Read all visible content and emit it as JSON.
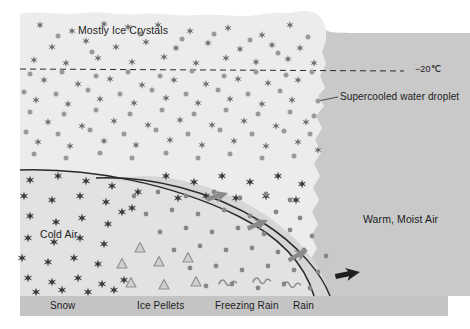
{
  "diagram": {
    "type": "meteorological-cross-section",
    "topic": "Winter precipitation types and temperature profile",
    "cloud_title": "Mostly Ice Crystals",
    "temperature_line_label": "−20℃",
    "callout_label": "Supercooled water droplet",
    "airmass_labels": {
      "cold": "Cold Air",
      "warm": "Warm, Moist Air"
    },
    "ground_labels": [
      {
        "name": "snow",
        "text": "Snow",
        "x": 50
      },
      {
        "name": "ice-pellets",
        "text": "Ice Pellets",
        "x": 137
      },
      {
        "name": "freezing-rain",
        "text": "Freezing Rain",
        "x": 215
      },
      {
        "name": "rain",
        "text": "Rain",
        "x": 293
      }
    ],
    "precipitation_symbols": {
      "ice_crystal": "six-pointed-star",
      "supercooled_droplet": "filled-circle",
      "ice_pellet": "outlined-triangle",
      "freezing_rain": "wavy-squiggle"
    },
    "arrows": {
      "warm_air_advection": "gray arrows pointing up and to the left along frontal surface",
      "inflow": "black arrow pointing left into warm sector"
    },
    "colors": {
      "cloud_fill": "#ececec",
      "cold_air_fill": "#e2e2e2",
      "warm_air_fill": "#c9c9c9",
      "warm_nose_fill": "#d6d6d6",
      "ground_fill": "#c4c4c4",
      "frontal_line": "#2a2a2a",
      "ice_crystal": "#3a3a3a",
      "droplet": "#9a9a9a",
      "ice_pellet_outline": "#8d8d8d",
      "gray_arrow": "#8a8a8a",
      "black_arrow": "#1f1f1f",
      "text": "#1c1c1c"
    }
  }
}
